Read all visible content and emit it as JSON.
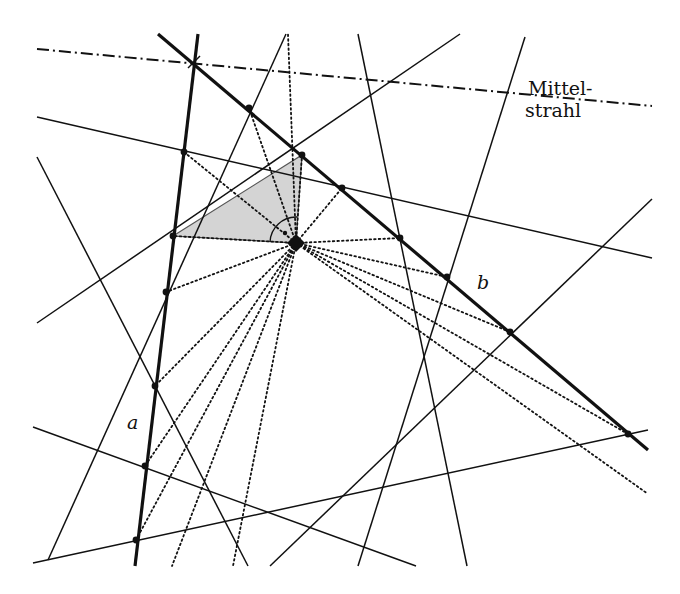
{
  "diagram": {
    "labels": {
      "mittelstrahl_line1": "Mittel-",
      "mittelstrahl_line2": "strahl",
      "line_a": "a",
      "line_b": "b"
    },
    "colors": {
      "line": "#111111",
      "shade": "#d4d4d4",
      "background": "#ffffff"
    },
    "center_point": [
      296,
      243
    ],
    "mittelstrahl": [
      [
        37,
        49
      ],
      [
        652,
        106
      ]
    ],
    "thick_lines": {
      "a": [
        [
          198,
          34
        ],
        [
          135,
          566
        ]
      ],
      "b": [
        [
          158,
          34
        ],
        [
          648,
          450
        ]
      ]
    },
    "thin_lines": [
      [
        [
          37,
          117
        ],
        [
          652,
          258
        ]
      ],
      [
        [
          37,
          157
        ],
        [
          248,
          566
        ]
      ],
      [
        [
          37,
          323
        ],
        [
          460,
          34
        ]
      ],
      [
        [
          48,
          560
        ],
        [
          286,
          34
        ]
      ],
      [
        [
          358,
          34
        ],
        [
          467,
          566
        ]
      ],
      [
        [
          525,
          37
        ],
        [
          358,
          566
        ]
      ],
      [
        [
          33,
          427
        ],
        [
          416,
          566
        ]
      ],
      [
        [
          33,
          563
        ],
        [
          648,
          430
        ]
      ],
      [
        [
          652,
          199
        ],
        [
          270,
          566
        ]
      ]
    ],
    "dotted_rays_to": [
      [
        249,
        108
      ],
      [
        184,
        152
      ],
      [
        173,
        236
      ],
      [
        166,
        292
      ],
      [
        155,
        386
      ],
      [
        145,
        466
      ],
      [
        136,
        540
      ],
      [
        288,
        34
      ],
      [
        302,
        155
      ],
      [
        342,
        188
      ],
      [
        400,
        238
      ],
      [
        447,
        277
      ],
      [
        510,
        332
      ],
      [
        628,
        434
      ],
      [
        648,
        494
      ],
      [
        172,
        566
      ],
      [
        233,
        566
      ]
    ],
    "intersection_points": [
      [
        194,
        62
      ],
      [
        249,
        108
      ],
      [
        302,
        155
      ],
      [
        342,
        188
      ],
      [
        400,
        238
      ],
      [
        447,
        277
      ],
      [
        510,
        332
      ],
      [
        628,
        434
      ],
      [
        184,
        152
      ],
      [
        173,
        236
      ],
      [
        166,
        292
      ],
      [
        155,
        386
      ],
      [
        145,
        466
      ],
      [
        136,
        540
      ]
    ],
    "shaded_triangle": [
      [
        173,
        236
      ],
      [
        302,
        155
      ],
      [
        296,
        243
      ]
    ],
    "right_angle_center": [
      296,
      243
    ],
    "right_angle_radius": 26
  }
}
